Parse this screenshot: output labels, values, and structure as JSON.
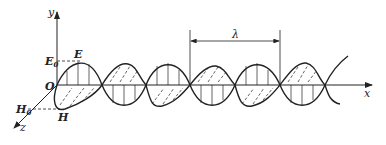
{
  "diagram": {
    "type": "electromagnetic-wave",
    "labels": {
      "y_axis": "y",
      "x_axis": "x",
      "z_axis": "z",
      "origin": "O",
      "E": "E",
      "E0": "E",
      "E0_sub": "0",
      "H": "H",
      "H0": "H",
      "H0_sub": "0",
      "wavelength": "λ"
    },
    "colors": {
      "stroke": "#222222",
      "background": "#ffffff"
    }
  }
}
